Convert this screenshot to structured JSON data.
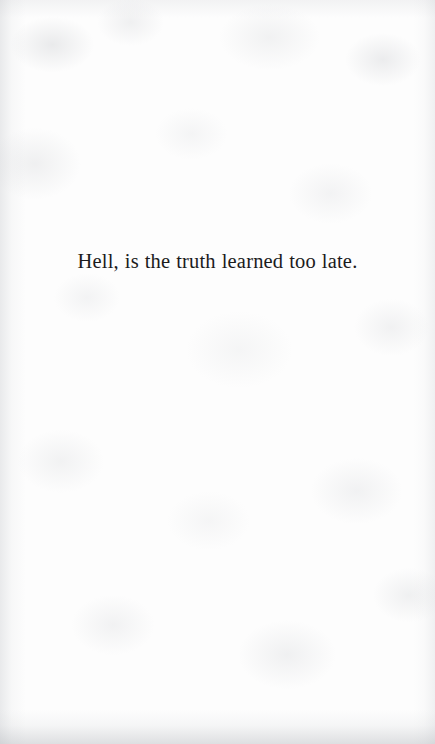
{
  "page": {
    "medium": "scanned-book-page",
    "width_px": 435,
    "height_px": 744,
    "paper_color": "#fdfdfd",
    "ink_color": "#1b1b1c"
  },
  "content": {
    "body_text": "Hell, is the truth learned too late."
  },
  "texture": {
    "left_edge_shade": "",
    "right_edge_shade": "",
    "top_edge_shade": "",
    "bottom_edge_shade": ""
  }
}
